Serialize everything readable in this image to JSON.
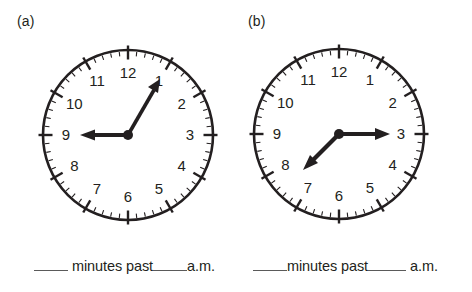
{
  "page": {
    "background": "#ffffff",
    "ink": "#231f20",
    "blank_rule_color": "#5a5a5a"
  },
  "panels": [
    {
      "id": "a",
      "label": "(a)",
      "clock": {
        "name": "analog-clock-a",
        "numerals": [
          "12",
          "1",
          "2",
          "3",
          "4",
          "5",
          "6",
          "7",
          "8",
          "9",
          "10",
          "11"
        ],
        "minute_ticks": 60,
        "hour_ticks": 12,
        "hour_hand_points_to": 9,
        "minute_hand_points_to": 1,
        "hour_hand_angle_deg": 270,
        "minute_hand_angle_deg": 30,
        "reads": "9:05"
      },
      "prompt": {
        "blank_minutes": "",
        "text_minutes_past": "minutes past",
        "blank_hour": "",
        "text_meridiem": "a.m."
      }
    },
    {
      "id": "b",
      "label": "(b)",
      "clock": {
        "name": "analog-clock-b",
        "numerals": [
          "12",
          "1",
          "2",
          "3",
          "4",
          "5",
          "6",
          "7",
          "8",
          "9",
          "10",
          "11"
        ],
        "minute_ticks": 60,
        "hour_ticks": 12,
        "hour_hand_points_to": 7.5,
        "minute_hand_points_to": 3,
        "hour_hand_angle_deg": 225,
        "minute_hand_angle_deg": 90,
        "reads": "7:15"
      },
      "prompt": {
        "blank_minutes": "",
        "text_minutes_past": "minutes past",
        "blank_hour": "",
        "text_meridiem": "a.m."
      }
    }
  ]
}
